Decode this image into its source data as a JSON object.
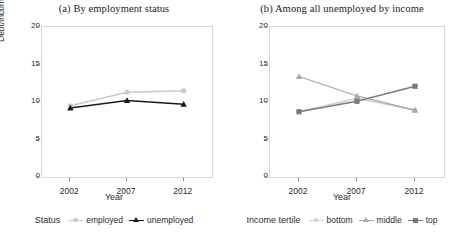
{
  "figure": {
    "xlabel": "Year",
    "ylabel": "Debt/income ratio (%)"
  },
  "panel_a": {
    "title": "(a) By employment status",
    "legend_title": "Status",
    "legend": [
      {
        "label": "employed",
        "marker": "circle-marker",
        "color": "#c9c9c9"
      },
      {
        "label": "unemployed",
        "marker": "triangle-marker",
        "color": "#1a1a1a"
      }
    ]
  },
  "panel_b": {
    "title": "(b) Among all unemployed by income",
    "legend_title": "Income tertile",
    "legend": [
      {
        "label": "bottom",
        "marker": "circle-marker",
        "color": "#cfcfcf"
      },
      {
        "label": "middle",
        "marker": "triangle-marker",
        "color": "#a8a8a8"
      },
      {
        "label": "top",
        "marker": "square-marker",
        "color": "#7a7a7a"
      }
    ]
  },
  "axis": {
    "yticks": [
      "0",
      "5",
      "10",
      "15",
      "20"
    ],
    "xticks": [
      "2002",
      "2007",
      "2012"
    ]
  },
  "chart_data": [
    {
      "type": "line",
      "panel": "a",
      "title": "(a) By employment status",
      "xlabel": "Year",
      "ylabel": "Debt/income ratio (%)",
      "x": [
        2002,
        2007,
        2012
      ],
      "categories": [
        "2002",
        "2007",
        "2012"
      ],
      "ylim": [
        0,
        20
      ],
      "yticks": [
        0,
        5,
        10,
        15,
        20
      ],
      "grid": false,
      "legend_position": "bottom",
      "legend_title": "Status",
      "series": [
        {
          "name": "employed",
          "values": [
            9.5,
            11.3,
            11.5
          ],
          "color": "#c9c9c9",
          "marker": "circle"
        },
        {
          "name": "unemployed",
          "values": [
            9.2,
            10.2,
            9.7
          ],
          "color": "#1a1a1a",
          "marker": "triangle"
        }
      ]
    },
    {
      "type": "line",
      "panel": "b",
      "title": "(b) Among all unemployed by income",
      "xlabel": "Year",
      "ylabel": "Debt/income ratio (%)",
      "x": [
        2002,
        2007,
        2012
      ],
      "categories": [
        "2002",
        "2007",
        "2012"
      ],
      "ylim": [
        0,
        20
      ],
      "yticks": [
        0,
        5,
        10,
        15,
        20
      ],
      "grid": false,
      "legend_position": "bottom",
      "legend_title": "Income tertile",
      "series": [
        {
          "name": "bottom",
          "values": [
            8.7,
            10.5,
            8.9
          ],
          "color": "#cfcfcf",
          "marker": "circle"
        },
        {
          "name": "middle",
          "values": [
            13.4,
            10.8,
            8.9
          ],
          "color": "#a8a8a8",
          "marker": "triangle"
        },
        {
          "name": "top",
          "values": [
            8.7,
            10.1,
            12.1
          ],
          "color": "#7a7a7a",
          "marker": "square"
        }
      ]
    }
  ]
}
